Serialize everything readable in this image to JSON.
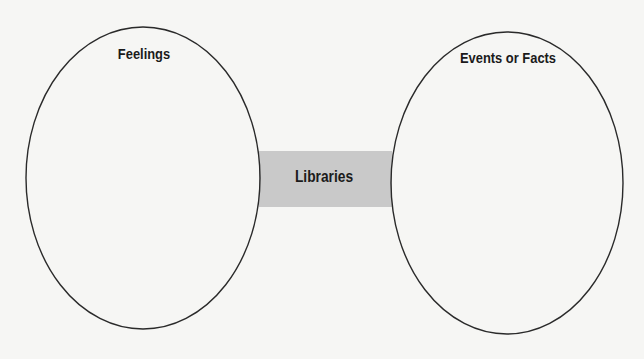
{
  "diagram": {
    "type": "two-ellipse connector diagram",
    "colors": {
      "background": "#f6f6f4",
      "ellipse_stroke": "#2a2a2a",
      "connector_fill": "#c9c9c9",
      "text": "#1b1b1b"
    },
    "nodes": [
      {
        "id": "left",
        "shape": "ellipse",
        "label": "Feelings"
      },
      {
        "id": "right",
        "shape": "ellipse",
        "label": "Events or Facts"
      }
    ],
    "connector": {
      "shape": "rectangle",
      "label": "Libraries",
      "connects": [
        "left",
        "right"
      ]
    }
  }
}
